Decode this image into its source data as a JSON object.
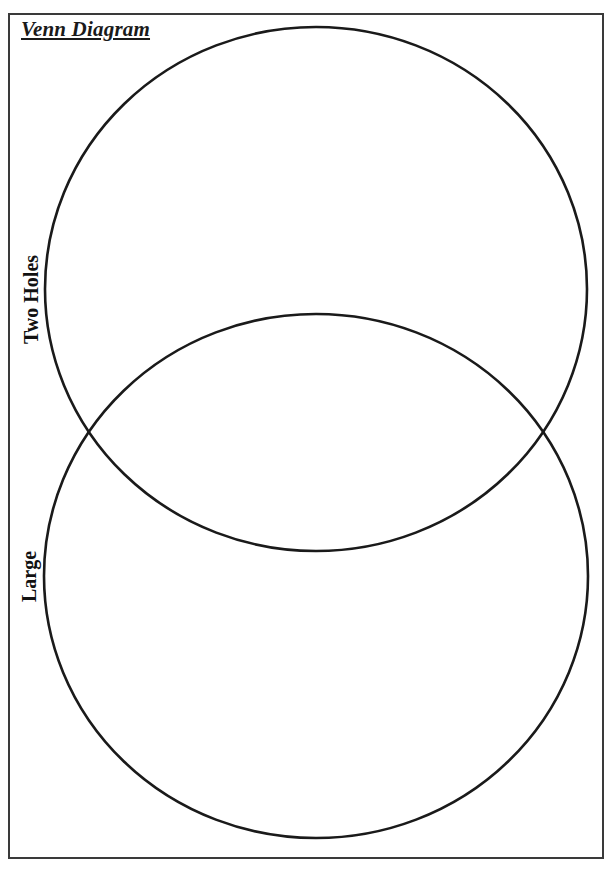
{
  "worksheet": {
    "title": "Venn Diagram",
    "colors": {
      "line": "#1a1a1a",
      "border": "#3a3a3a",
      "background": "#ffffff"
    }
  },
  "diagram": {
    "type": "venn",
    "sets": [
      {
        "id": "top",
        "label": "Two Holes",
        "cx": 316,
        "cy": 289,
        "rx": 271,
        "ry": 262
      },
      {
        "id": "bottom",
        "label": "Large",
        "cx": 316,
        "cy": 576,
        "rx": 272,
        "ry": 262
      }
    ]
  }
}
